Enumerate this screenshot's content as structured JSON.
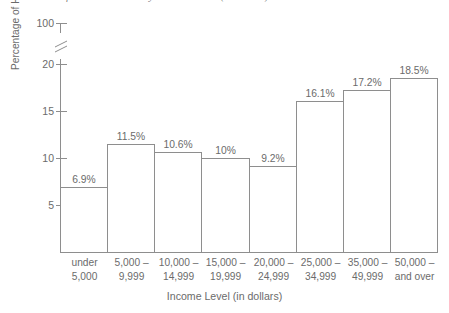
{
  "chart_data": {
    "type": "bar",
    "title": "Distribution of Household Income by U.S. Households (1974-1975)",
    "xlabel": "Income Level (in dollars)",
    "ylabel": "Percentage of Households",
    "categories": [
      "under 5,000",
      "5,000 – 9,999",
      "10,000 – 14,999",
      "15,000 – 19,999",
      "20,000 – 24,999",
      "25,000 – 34,999",
      "35,000 – 49,999",
      "50,000 – and over"
    ],
    "category_lines": [
      {
        "line1": "under",
        "line2": "5,000"
      },
      {
        "line1": "5,000 –",
        "line2": "9,999"
      },
      {
        "line1": "10,000 –",
        "line2": "14,999"
      },
      {
        "line1": "15,000 –",
        "line2": "19,999"
      },
      {
        "line1": "20,000 –",
        "line2": "24,999"
      },
      {
        "line1": "25,000 –",
        "line2": "34,999"
      },
      {
        "line1": "35,000 –",
        "line2": "49,999"
      },
      {
        "line1": "50,000 –",
        "line2": "and over"
      }
    ],
    "values": [
      6.9,
      11.5,
      10.6,
      10.0,
      9.2,
      16.1,
      17.2,
      18.5
    ],
    "value_labels": [
      "6.9%",
      "11.5%",
      "10.6%",
      "10%",
      "9.2%",
      "16.1%",
      "17.2%",
      "18.5%"
    ],
    "ytick_labels": [
      "5",
      "10",
      "15",
      "20",
      "100"
    ],
    "ytick_values": [
      5,
      10,
      15,
      20,
      100
    ],
    "ylim": [
      0,
      20
    ],
    "axis_break": true,
    "axis_break_between": [
      20,
      100
    ],
    "grid": false,
    "legend": "none",
    "bar_fill": "#ffffff",
    "bar_stroke": "#8e8e8e",
    "axis_color": "#8e8e8e",
    "text_color": "#6b6b6b"
  }
}
